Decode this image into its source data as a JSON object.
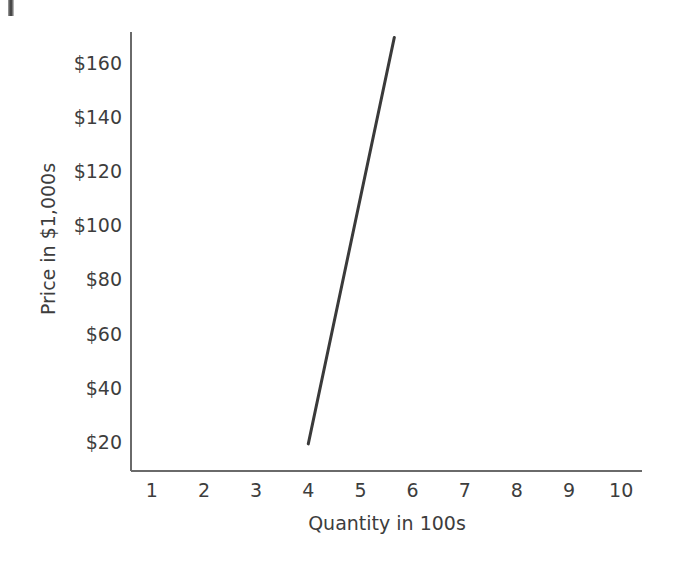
{
  "chart_data": {
    "type": "line",
    "title": "",
    "xlabel": "Quantity in 100s",
    "ylabel": "Price in $1,000s",
    "xlim": [
      0.6,
      10.4
    ],
    "ylim": [
      10,
      172
    ],
    "grid": false,
    "legend": null,
    "x_tick_labels": [
      "1",
      "2",
      "3",
      "4",
      "5",
      "6",
      "7",
      "8",
      "9",
      "10"
    ],
    "x_tick_values": [
      1,
      2,
      3,
      4,
      5,
      6,
      7,
      8,
      9,
      10
    ],
    "y_tick_labels": [
      "$20",
      "$40",
      "$60",
      "$80",
      "$100",
      "$120",
      "$140",
      "$160"
    ],
    "y_tick_values": [
      20,
      40,
      60,
      80,
      100,
      120,
      140,
      160
    ],
    "series": [
      {
        "name": "Supply curve",
        "type": "line",
        "color": "#3a3a3a",
        "line_width": 3,
        "x": [
          4.0,
          5.65
        ],
        "y": [
          20,
          170
        ],
        "points": [
          {
            "x": 4.0,
            "y": 20
          },
          {
            "x": 5.65,
            "y": 170
          }
        ]
      }
    ],
    "axis_color": "#6a6a6a",
    "text_color": "#3d3d3d",
    "background": "#ffffff"
  },
  "figure": {
    "axis_line_color": "#6a6a6a",
    "curve_color": "#3a3a3a",
    "background": "#ffffff"
  }
}
